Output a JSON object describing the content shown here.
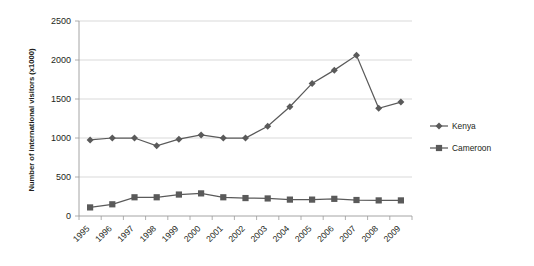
{
  "chart_data": {
    "type": "line",
    "title": "",
    "xlabel": "",
    "ylabel": "Number of international visitors (x1000)",
    "categories": [
      "1995",
      "1996",
      "1997",
      "1998",
      "1999",
      "2000",
      "2001",
      "2002",
      "2003",
      "2004",
      "2005",
      "2006",
      "2007",
      "2008",
      "2009"
    ],
    "ylim": [
      0,
      2500
    ],
    "yticks": [
      0,
      500,
      1000,
      1500,
      2000,
      2500
    ],
    "ytick_labels": [
      "0",
      "500",
      "1000",
      "1500",
      "2000",
      "2500"
    ],
    "grid": true,
    "legend_position": "right",
    "series": [
      {
        "name": "Kenya",
        "marker": "diamond",
        "color": "#5a5a5a",
        "values": [
          975,
          1000,
          1000,
          900,
          985,
          1040,
          1000,
          1000,
          1150,
          1400,
          1700,
          1870,
          2060,
          1380,
          1460
        ]
      },
      {
        "name": "Cameroon",
        "marker": "square",
        "color": "#5a5a5a",
        "values": [
          110,
          150,
          240,
          240,
          275,
          290,
          240,
          230,
          225,
          210,
          210,
          220,
          205,
          200,
          200
        ]
      }
    ]
  },
  "legend": {
    "items": [
      {
        "label": "Kenya"
      },
      {
        "label": "Cameroon"
      }
    ]
  },
  "colors": {
    "series": "#5a5a5a",
    "grid": "#c9c9c9",
    "axis": "#9a9a9a",
    "text": "#231f20",
    "background": "#ffffff"
  }
}
